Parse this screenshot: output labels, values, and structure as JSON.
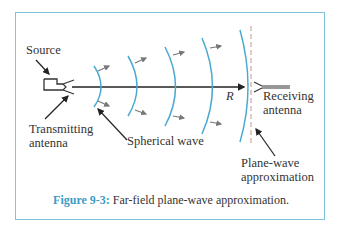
{
  "figure": {
    "number_label": "Figure 9-3:",
    "caption_text": "Far-field plane-wave approximation."
  },
  "labels": {
    "source": "Source",
    "transmitting_line1": "Transmitting",
    "transmitting_line2": "antenna",
    "spherical_wave": "Spherical wave",
    "receiving_line1": "Receiving",
    "receiving_line2": "antenna",
    "plane_wave_line1": "Plane-wave",
    "plane_wave_line2": "approximation",
    "distance": "R"
  },
  "colors": {
    "frame": "#7fc4dd",
    "wavefront": "#4aa9d1",
    "caption_accent": "#3b9cc7",
    "plane_wave_dashed": "#c8a89a",
    "arrow": "#777777",
    "text": "#333333"
  }
}
